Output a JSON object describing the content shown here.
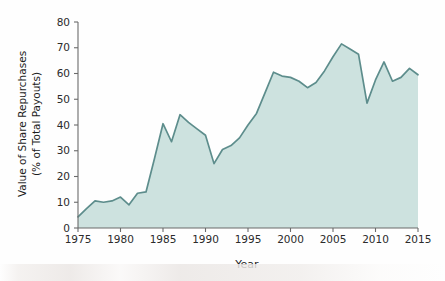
{
  "chart_data": {
    "type": "area",
    "title": "",
    "xlabel": "Year",
    "ylabel": "Value of Share Repurchases (% of Total Payouts)",
    "ylabel_line1": "Value of Share Repurchases",
    "ylabel_line2": "(% of Total Payouts)",
    "xlim": [
      1975,
      2015
    ],
    "ylim": [
      0,
      80
    ],
    "xticks": [
      1975,
      1980,
      1985,
      1990,
      1995,
      2000,
      2005,
      2010,
      2015
    ],
    "xtick_labels": [
      "1975",
      "1980",
      "1985",
      "1990",
      "1995",
      "2000",
      "2005",
      "2010",
      "2015"
    ],
    "yticks": [
      0,
      10,
      20,
      30,
      40,
      50,
      60,
      70,
      80
    ],
    "ytick_labels": [
      "0",
      "10",
      "20",
      "30",
      "40",
      "50",
      "60",
      "70",
      "80"
    ],
    "grid": false,
    "legend": false,
    "line_color": "#5d8d8c",
    "fill_color": "#cde2df",
    "axis_color": "#6b6b6b",
    "x": [
      1975,
      1976,
      1977,
      1978,
      1979,
      1980,
      1981,
      1982,
      1983,
      1984,
      1985,
      1986,
      1987,
      1988,
      1989,
      1990,
      1991,
      1992,
      1993,
      1994,
      1995,
      1996,
      1997,
      1998,
      1999,
      2000,
      2001,
      2002,
      2003,
      2004,
      2005,
      2006,
      2007,
      2008,
      2009,
      2010,
      2011,
      2012,
      2013,
      2014,
      2015
    ],
    "values": [
      4.3,
      7.5,
      10.5,
      10.0,
      10.5,
      12.0,
      9.0,
      13.5,
      14.0,
      27.0,
      40.5,
      33.5,
      44.0,
      41.0,
      38.5,
      36.0,
      25.0,
      30.5,
      32.0,
      35.0,
      40.0,
      44.5,
      52.5,
      60.5,
      59.0,
      58.5,
      57.0,
      54.5,
      56.5,
      61.0,
      66.5,
      71.5,
      69.5,
      67.5,
      48.5,
      57.5,
      64.5,
      57.0,
      58.5,
      62.0,
      59.5
    ],
    "series": [
      {
        "name": "Value of Share Repurchases (% of Total Payouts)",
        "values": [
          4.3,
          7.5,
          10.5,
          10.0,
          10.5,
          12.0,
          9.0,
          13.5,
          14.0,
          27.0,
          40.5,
          33.5,
          44.0,
          41.0,
          38.5,
          36.0,
          25.0,
          30.5,
          32.0,
          35.0,
          40.0,
          44.5,
          52.5,
          60.5,
          59.0,
          58.5,
          57.0,
          54.5,
          56.5,
          61.0,
          66.5,
          71.5,
          69.5,
          67.5,
          48.5,
          57.5,
          64.5,
          57.0,
          58.5,
          62.0,
          59.5
        ]
      }
    ]
  }
}
